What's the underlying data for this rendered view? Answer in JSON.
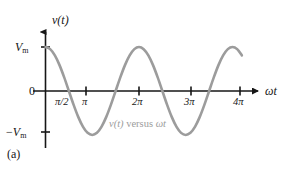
{
  "figure": {
    "panel_label": "(a)",
    "background_color": "#ffffff",
    "axis_color": "#161616",
    "curve_color": "#9c9c9c",
    "annotation_color": "#9c9c9c"
  },
  "axes": {
    "y_axis_label": "v(t)",
    "x_axis_label": "ωt",
    "origin_label": "0",
    "y_positive_label_main": "V",
    "y_positive_label_sub": "m",
    "y_negative_sign": "−",
    "y_negative_label_main": "V",
    "y_negative_label_sub": "m"
  },
  "annotations": {
    "curve_caption_italic_1": "v(t)",
    "curve_caption_roman": " versus ",
    "curve_caption_italic_2": "ωt"
  },
  "chart_data": {
    "type": "line",
    "title": "",
    "subtitle": "",
    "xlabel": "ωt",
    "ylabel": "v(t)",
    "function": "v(t) = Vm cos(ωt)",
    "xlim": [
      0,
      4.35
    ],
    "ylim": [
      -1.18,
      1.18
    ],
    "grid": false,
    "legend_position": "none",
    "x_tick_labels": [
      "π/2",
      "π",
      "2π",
      "3π",
      "4π"
    ],
    "x_tick_values": [
      0.5,
      1,
      2,
      3,
      4
    ],
    "x_tick_units": "π radians",
    "x_tick_marks_drawn": [
      1,
      2,
      3,
      4
    ],
    "y_tick_labels": [
      "Vm",
      "0",
      "−Vm"
    ],
    "y_tick_values": [
      1,
      0,
      -1
    ],
    "amplitude": 1,
    "period_in_pi": 2,
    "phase": "cosine (starts at maximum)",
    "series": [
      {
        "name": "v(t) versus ωt",
        "color": "#9c9c9c",
        "x": [
          0,
          0.1,
          0.2,
          0.3,
          0.4,
          0.5,
          0.6,
          0.7,
          0.8,
          0.9,
          1.0,
          1.1,
          1.2,
          1.3,
          1.4,
          1.5,
          1.6,
          1.7,
          1.8,
          1.9,
          2.0,
          2.1,
          2.2,
          2.3,
          2.4,
          2.5,
          2.6,
          2.7,
          2.8,
          2.9,
          3.0,
          3.1,
          3.2,
          3.3,
          3.4,
          3.5,
          3.6,
          3.7,
          3.8,
          3.9,
          4.0,
          4.1,
          4.2
        ],
        "y": [
          1.0,
          0.951,
          0.809,
          0.588,
          0.309,
          0.0,
          -0.309,
          -0.588,
          -0.809,
          -0.951,
          -1.0,
          -0.951,
          -0.809,
          -0.588,
          -0.309,
          0.0,
          0.309,
          0.588,
          0.809,
          0.951,
          1.0,
          0.951,
          0.809,
          0.588,
          0.309,
          0.0,
          -0.309,
          -0.588,
          -0.809,
          -0.951,
          -1.0,
          -0.951,
          -0.809,
          -0.588,
          -0.309,
          0.0,
          0.309,
          0.588,
          0.809,
          0.951,
          1.0,
          0.951,
          0.809
        ]
      }
    ],
    "zero_crossings_in_pi": [
      0.5,
      1.5,
      2.5,
      3.5
    ],
    "maxima_in_pi": [
      0,
      2,
      4
    ],
    "minima_in_pi": [
      1,
      3
    ]
  }
}
